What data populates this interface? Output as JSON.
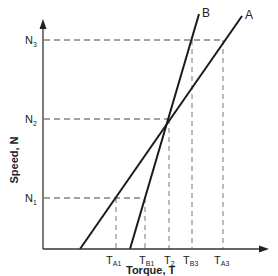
{
  "diagram": {
    "x_axis": {
      "label": "Torque, T"
    },
    "y_axis": {
      "label": "Speed, N"
    },
    "curves": [
      {
        "name": "A"
      },
      {
        "name": "B"
      }
    ],
    "speed_levels": {
      "N1": {
        "main": "N",
        "sub": "1"
      },
      "N2": {
        "main": "N",
        "sub": "2"
      },
      "N3": {
        "main": "N",
        "sub": "3"
      }
    },
    "torque_ticks": {
      "TA1": {
        "main": "T",
        "sub": "A1"
      },
      "TB1": {
        "main": "T",
        "sub": "B1"
      },
      "T2": {
        "main": "T",
        "sub": "2"
      },
      "TB3": {
        "main": "T",
        "sub": "B3"
      },
      "TA3": {
        "main": "T",
        "sub": "A3"
      }
    }
  }
}
